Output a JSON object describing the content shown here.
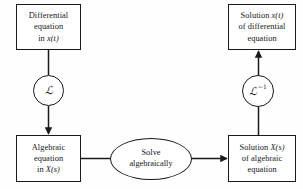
{
  "diagram": {
    "background_color": "#fefefe",
    "stroke_color": "#1a1a1a",
    "text_color": "#17171a",
    "nodes": {
      "differential_equation": {
        "shape": "rectangle",
        "line1": "Differential",
        "line2": "equation",
        "line3_prefix": "in ",
        "line3_var": "x(t)"
      },
      "solution_differential": {
        "shape": "rectangle",
        "line1_prefix": "Solution ",
        "line1_var": "x(t)",
        "line2": "of differential",
        "line3": "equation"
      },
      "algebraic_equation": {
        "shape": "rectangle",
        "line1": "Algebraic",
        "line2": "equation",
        "line3_prefix": "in ",
        "line3_var": "X(s)"
      },
      "solution_algebraic": {
        "shape": "rectangle",
        "line1_prefix": "Solution ",
        "line1_var": "X(s)",
        "line2": "of algebraic",
        "line3": "equation"
      },
      "solve_algebraically": {
        "shape": "ellipse",
        "line1": "Solve",
        "line2": "algebraically"
      },
      "laplace_operator": {
        "shape": "circle",
        "symbol": "ℒ",
        "exponent": ""
      },
      "inverse_laplace_operator": {
        "shape": "circle",
        "symbol": "ℒ",
        "exponent": "−1"
      }
    },
    "edges": [
      {
        "name": "differential-to-algebraic",
        "from": "differential_equation",
        "to": "algebraic_equation",
        "via": "laplace_operator",
        "direction": "down",
        "arrowhead": true
      },
      {
        "name": "algebraic-to-solve",
        "from": "algebraic_equation",
        "to": "solve_algebraically",
        "direction": "right",
        "arrowhead": false
      },
      {
        "name": "solve-to-solution-algebraic",
        "from": "solve_algebraically",
        "to": "solution_algebraic",
        "direction": "right",
        "arrowhead": true
      },
      {
        "name": "solution-algebraic-to-solution-differential",
        "from": "solution_algebraic",
        "to": "solution_differential",
        "via": "inverse_laplace_operator",
        "direction": "up",
        "arrowhead": true
      }
    ]
  }
}
